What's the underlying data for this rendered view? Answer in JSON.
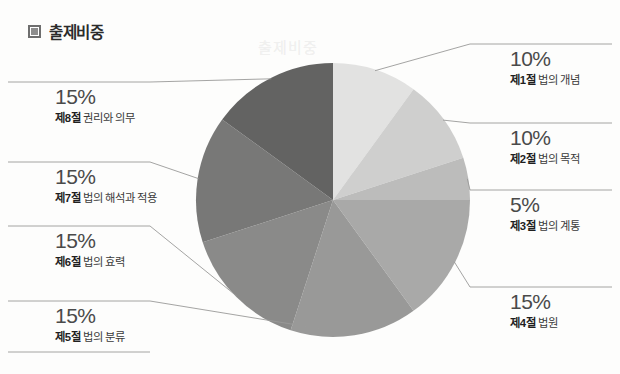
{
  "header": {
    "title": "출제비중",
    "icon": "square-bullet-icon"
  },
  "chart_data": {
    "type": "pie",
    "title": "출제비중",
    "start_angle_deg": 0,
    "direction": "clockwise",
    "legend": "callout-labels",
    "categories": [
      "제1절 법의 개념",
      "제2절 법의 목적",
      "제3절 법의 계통",
      "제4절 법원",
      "제5절 법의 분류",
      "제6절 법의 효력",
      "제7절 법의 해석과 적용",
      "제8절 권리와 의무"
    ],
    "values": [
      10,
      10,
      5,
      15,
      15,
      15,
      15,
      15
    ],
    "value_labels": [
      "10%",
      "10%",
      "5%",
      "15%",
      "15%",
      "15%",
      "15%",
      "15%"
    ],
    "colors": [
      "#e2e2e1",
      "#cfcfce",
      "#bcbcbb",
      "#a9a9a8",
      "#999998",
      "#8a8a89",
      "#787877",
      "#636362"
    ],
    "slices": [
      {
        "id": "s1",
        "section": "제1절",
        "name": "법의 개념",
        "percent": "10%",
        "value": 10,
        "color": "#e2e2e1",
        "side": "right"
      },
      {
        "id": "s2",
        "section": "제2절",
        "name": "법의 목적",
        "percent": "10%",
        "value": 10,
        "color": "#cfcfce",
        "side": "right"
      },
      {
        "id": "s3",
        "section": "제3절",
        "name": "법의 계통",
        "percent": "5%",
        "value": 5,
        "color": "#bcbcbb",
        "side": "right"
      },
      {
        "id": "s4",
        "section": "제4절",
        "name": "법원",
        "percent": "15%",
        "value": 15,
        "color": "#a9a9a8",
        "side": "right"
      },
      {
        "id": "s5",
        "section": "제5절",
        "name": "법의 분류",
        "percent": "15%",
        "value": 15,
        "color": "#999998",
        "side": "left"
      },
      {
        "id": "s6",
        "section": "제6절",
        "name": "법의 효력",
        "percent": "15%",
        "value": 15,
        "color": "#8a8a89",
        "side": "left"
      },
      {
        "id": "s7",
        "section": "제7절",
        "name": "법의 해석과 적용",
        "percent": "15%",
        "value": 15,
        "color": "#787877",
        "side": "left"
      },
      {
        "id": "s8",
        "section": "제8절",
        "name": "권리와 의무",
        "percent": "15%",
        "value": 15,
        "color": "#636362",
        "side": "left"
      }
    ]
  },
  "labels": {
    "right": [
      {
        "percent": "10%",
        "section": "제1절",
        "name": "법의 개념"
      },
      {
        "percent": "10%",
        "section": "제2절",
        "name": "법의 목적"
      },
      {
        "percent": "5%",
        "section": "제3절",
        "name": "법의 계통"
      },
      {
        "percent": "15%",
        "section": "제4절",
        "name": "법원"
      }
    ],
    "left": [
      {
        "percent": "15%",
        "section": "제8절",
        "name": "권리와 의무"
      },
      {
        "percent": "15%",
        "section": "제7절",
        "name": "법의 해석과 적용"
      },
      {
        "percent": "15%",
        "section": "제6절",
        "name": "법의 효력"
      },
      {
        "percent": "15%",
        "section": "제5절",
        "name": "법의 분류"
      }
    ]
  },
  "ghost_text": {
    "a": "출제비중",
    "b": "출제비중"
  },
  "style": {
    "background": "#fdfdfc",
    "rule_color": "#9a9a99",
    "text_color": "#3a3a3a"
  }
}
